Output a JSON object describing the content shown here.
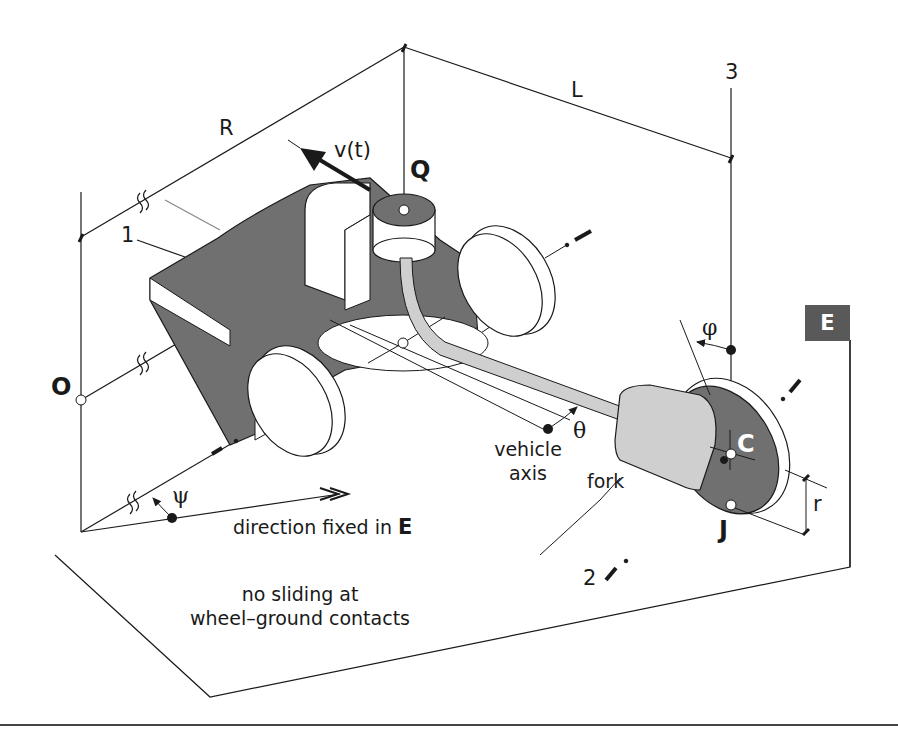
{
  "figure": {
    "type": "isometric mechanism diagram",
    "colors": {
      "body_fill": "#707070",
      "fork_fill": "#cfcfcf",
      "wheel_fill": "#ffffff",
      "ink": "#1a1a1a",
      "frame_badge": "#595959"
    }
  },
  "labels": {
    "R": "R",
    "L": "L",
    "axis_3": "3",
    "axis_2": "2",
    "axis_1": "1",
    "velocity": "v(t)",
    "point_Q": "Q",
    "point_O": "O",
    "point_C": "C",
    "point_J": "J",
    "frame_E": "E",
    "angle_phi": "φ",
    "angle_theta": "θ",
    "angle_psi": "ψ",
    "radius_r": "r",
    "fork": "fork",
    "vehicle_axis_line1": "vehicle",
    "vehicle_axis_line2": "axis",
    "direction_text": "direction fixed in ",
    "direction_E": "E",
    "constraint_line1": "no sliding at",
    "constraint_line2": "wheel–ground contacts"
  }
}
